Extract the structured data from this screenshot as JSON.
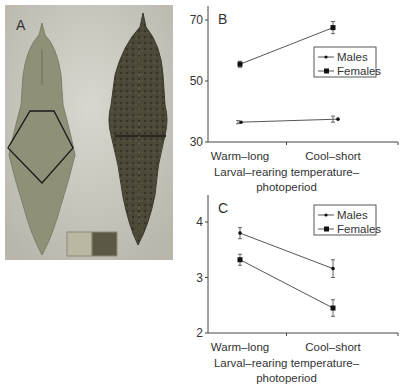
{
  "panel_a": {
    "label": "A",
    "description": "Photograph of two pupae (light green-brown left, dark mottled right) with pentagon measurement region and two color swatches"
  },
  "chart_data": [
    {
      "panel": "B",
      "type": "line",
      "title": "",
      "xlabel": "Larval–rearing temperature–photoperiod",
      "xlabel_lines": [
        "Larval–rearing temperature–",
        "photoperiod"
      ],
      "ylabel": "",
      "categories": [
        "Warm–long",
        "Cool–short"
      ],
      "ylim": [
        30,
        70
      ],
      "yticks": [
        30,
        50,
        70
      ],
      "grid": false,
      "legend_position": "upper right",
      "series": [
        {
          "name": "Males",
          "marker": "small-dot",
          "values": [
            36.5,
            37.5
          ],
          "errors": [
            0.5,
            1.0
          ]
        },
        {
          "name": "Females",
          "marker": "square",
          "values": [
            55.5,
            67.5
          ],
          "errors": [
            1.0,
            2.0
          ]
        }
      ]
    },
    {
      "panel": "C",
      "type": "line",
      "title": "",
      "xlabel": "Larval–rearing temperature–photoperiod",
      "xlabel_lines": [
        "Larval–rearing temperature–",
        "photoperiod"
      ],
      "ylabel": "",
      "categories": [
        "Warm–long",
        "Cool–short"
      ],
      "ylim": [
        2,
        4.4
      ],
      "yticks": [
        2,
        3,
        4
      ],
      "grid": false,
      "legend_position": "upper right",
      "series": [
        {
          "name": "Males",
          "marker": "small-dot",
          "values": [
            3.8,
            3.16
          ],
          "errors": [
            0.1,
            0.16
          ]
        },
        {
          "name": "Females",
          "marker": "square",
          "values": [
            3.32,
            2.45
          ],
          "errors": [
            0.1,
            0.15
          ]
        }
      ]
    }
  ],
  "colors": {
    "line": "#555555",
    "marker": "#111111",
    "axis": "#444444",
    "pupa_light": "#8f8e77",
    "pupa_dark": "#4a4737",
    "background_photo": "#c9c7bd"
  }
}
